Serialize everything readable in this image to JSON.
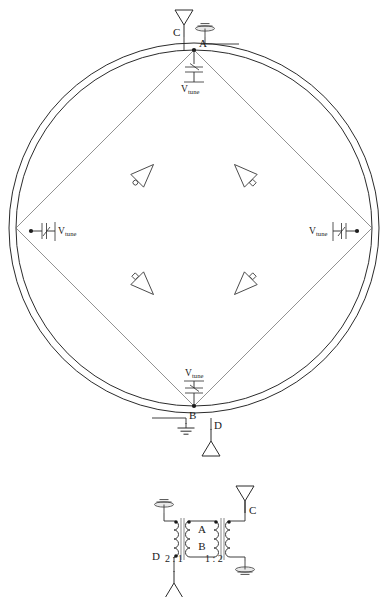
{
  "figure": {
    "stroke_color": "#2b2b2b",
    "diagonal_color": "#6d6d6d",
    "background": "#ffffff"
  },
  "ring_schematic": {
    "nodes": [
      {
        "id": "A",
        "label": "A",
        "position": "top-inner-ring"
      },
      {
        "id": "B",
        "label": "B",
        "position": "bottom-inner-ring"
      },
      {
        "id": "C",
        "label": "C",
        "position": "top-antenna"
      },
      {
        "id": "D",
        "label": "D",
        "position": "bottom-antenna"
      }
    ],
    "antennas": [
      {
        "label": "C",
        "icon": "antenna-icon",
        "location": "top"
      },
      {
        "label": "D",
        "icon": "antenna-icon",
        "location": "bottom"
      }
    ],
    "grounds": [
      {
        "icon": "chassis-ground-icon",
        "location": "top-right-of-C"
      },
      {
        "icon": "earth-ground-icon",
        "location": "bottom-left-of-D"
      }
    ],
    "varactors": [
      {
        "label": "V",
        "sublabel": "tune",
        "orientation": "vertical",
        "location": "top",
        "icon": "varactor-icon"
      },
      {
        "label": "V",
        "sublabel": "tune",
        "orientation": "horizontal",
        "location": "left",
        "icon": "varactor-icon"
      },
      {
        "label": "V",
        "sublabel": "tune",
        "orientation": "horizontal",
        "location": "right",
        "icon": "varactor-icon"
      },
      {
        "label": "V",
        "sublabel": "tune",
        "orientation": "vertical",
        "location": "bottom",
        "icon": "varactor-icon"
      }
    ],
    "inverters": [
      {
        "id": "inv-top-left",
        "icon": "inverter-icon",
        "direction": "up-right",
        "bubble": "output"
      },
      {
        "id": "inv-top-right",
        "icon": "inverter-icon",
        "direction": "up-left",
        "bubble": "output"
      },
      {
        "id": "inv-bottom-left",
        "icon": "inverter-icon",
        "direction": "down-right",
        "bubble": "input"
      },
      {
        "id": "inv-bottom-right",
        "icon": "inverter-icon",
        "direction": "down-left",
        "bubble": "input"
      }
    ]
  },
  "transformer_schematic": {
    "labels": {
      "port_a": "A",
      "port_b": "B",
      "port_c": "C",
      "port_d": "D",
      "ratio_left": "2 : 1",
      "ratio_right": "1 : 2"
    },
    "antennas": [
      {
        "label": "C",
        "icon": "antenna-icon",
        "location": "top-right"
      },
      {
        "label": "D",
        "icon": "antenna-icon",
        "location": "bottom-left"
      }
    ],
    "grounds": [
      {
        "icon": "chassis-ground-icon",
        "location": "top-left"
      },
      {
        "icon": "chassis-ground-icon",
        "location": "bottom-right"
      }
    ],
    "windings": 4,
    "polarity_dots": 6
  }
}
